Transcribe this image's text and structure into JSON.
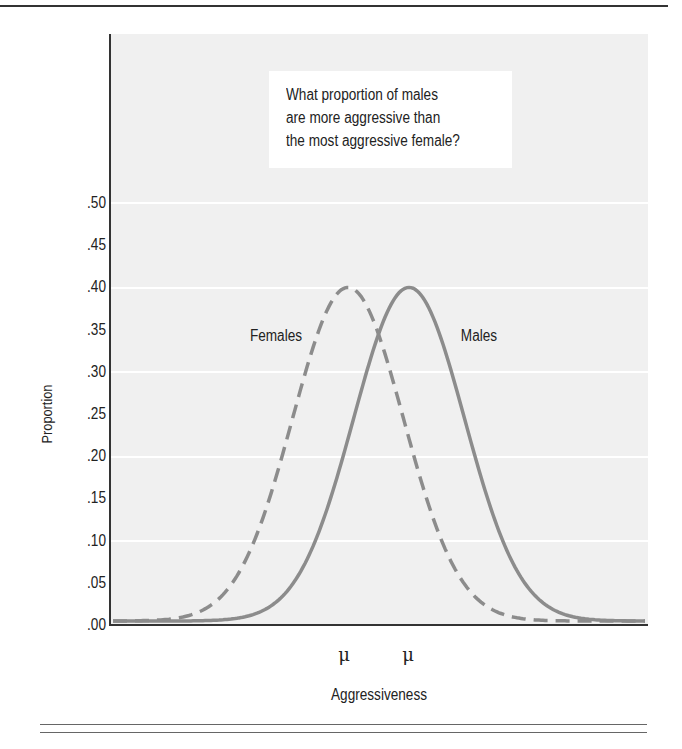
{
  "chart_data": {
    "type": "line",
    "title": "",
    "annotation": "What proportion of males are more aggressive than the most aggressive female?",
    "annotation_lines": [
      "What proportion of males",
      "are more aggressive than",
      "the most aggressive female?"
    ],
    "xlabel": "Aggressiveness",
    "ylabel": "Proportion",
    "ylim": [
      0.0,
      0.5
    ],
    "yticks": [
      ".00",
      ".05",
      ".10",
      ".15",
      ".20",
      ".25",
      ".30",
      ".35",
      ".40",
      ".45",
      ".50"
    ],
    "xticks": [
      "μ",
      "μ"
    ],
    "grid": "horizontal every 0.10",
    "legend": "inline labels",
    "series": [
      {
        "name": "Females",
        "style": "dashed",
        "color": "#8c8c8c",
        "distribution": "normal",
        "mean_label": "μ",
        "peak": 0.4,
        "relative_mean": 0.0,
        "relative_sd": 1.0
      },
      {
        "name": "Males",
        "style": "solid",
        "color": "#8c8c8c",
        "distribution": "normal",
        "mean_label": "μ",
        "peak": 0.4,
        "relative_mean": 1.1,
        "relative_sd": 1.0
      }
    ],
    "curve_intersection_proportion": 0.34
  },
  "labels": {
    "females": "Females",
    "males": "Males",
    "mu_female": "μ",
    "mu_male": "μ",
    "xlabel": "Aggressiveness",
    "ylabel": "Proportion"
  },
  "colors": {
    "plot_background": "#f0f0f0",
    "curve": "#8c8c8c",
    "axis": "#333333"
  }
}
